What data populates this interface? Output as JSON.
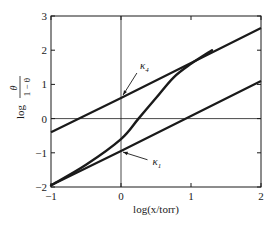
{
  "chart_data": {
    "type": "line",
    "title": "",
    "xlabel": "log(x/torr)",
    "ylabel": "log θ/(1 − θ)",
    "ylabel_parts": {
      "prefix": "log",
      "numerator": "θ",
      "denominator": "1 − θ"
    },
    "xlim": [
      -1,
      2
    ],
    "ylim": [
      -2,
      3
    ],
    "xticks": [
      -1,
      0,
      1,
      2
    ],
    "xtick_labels": [
      "−1",
      "0",
      "1",
      "2"
    ],
    "yticks": [
      -2,
      -1,
      0,
      1,
      2,
      3
    ],
    "ytick_labels": [
      "−2",
      "−1",
      "0",
      "1",
      "2",
      "3"
    ],
    "grid": false,
    "reference_lines": [
      {
        "axis": "x",
        "value": 0
      },
      {
        "axis": "y",
        "value": 0
      }
    ],
    "series": [
      {
        "name": "K4",
        "style": "straight line",
        "x": [
          -1,
          0,
          2
        ],
        "y": [
          -0.4,
          0.6,
          2.65
        ]
      },
      {
        "name": "K1",
        "style": "straight line",
        "x": [
          -1,
          0,
          2
        ],
        "y": [
          -1.95,
          -0.95,
          1.1
        ]
      },
      {
        "name": "isotherm",
        "style": "sigmoid curve",
        "x": [
          -1,
          -0.5,
          0,
          0.25,
          0.5,
          0.75,
          1.0,
          1.3
        ],
        "y": [
          -1.95,
          -1.35,
          -0.6,
          0.0,
          0.6,
          1.2,
          1.6,
          2.0
        ]
      }
    ],
    "annotations": [
      {
        "text": "K4",
        "subscript": "4",
        "points_to": [
          0,
          0.6
        ],
        "label_at": [
          0.27,
          1.45
        ]
      },
      {
        "text": "K1",
        "subscript": "1",
        "points_to": [
          0,
          -0.95
        ],
        "label_at": [
          0.45,
          -1.35
        ]
      }
    ],
    "legend": null
  },
  "labels": {
    "k4_main": "K",
    "k4_sub": "4",
    "k1_main": "K",
    "k1_sub": "1"
  }
}
